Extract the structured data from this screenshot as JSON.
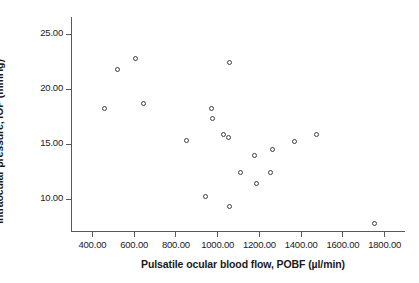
{
  "chart_data": {
    "type": "scatter",
    "title": "",
    "xlabel": "Pulsatile ocular blood flow, POBF (µl/min)",
    "ylabel": "Intraocular pressure, IOP (mmHg)",
    "xlim": [
      300,
      1900
    ],
    "ylim": [
      7,
      26.5
    ],
    "grid": false,
    "legend": null,
    "xticks": [
      400,
      600,
      800,
      1000,
      1200,
      1400,
      1600,
      1800
    ],
    "xtick_labels": [
      "400.00",
      "600.00",
      "800.00",
      "1000.00",
      "1200.00",
      "1400.00",
      "1600.00",
      "1800.00"
    ],
    "yticks": [
      10,
      15,
      20,
      25
    ],
    "ytick_labels": [
      "10.00",
      "15.00",
      "20.00",
      "25.00"
    ],
    "marker": "open-circle",
    "marker_color": "#3a3f44",
    "points": [
      {
        "x": 460,
        "y": 18.2
      },
      {
        "x": 525,
        "y": 21.7
      },
      {
        "x": 610,
        "y": 22.7
      },
      {
        "x": 645,
        "y": 18.7
      },
      {
        "x": 855,
        "y": 15.3
      },
      {
        "x": 945,
        "y": 10.2
      },
      {
        "x": 975,
        "y": 18.2
      },
      {
        "x": 980,
        "y": 17.3
      },
      {
        "x": 1030,
        "y": 15.8
      },
      {
        "x": 1055,
        "y": 15.6
      },
      {
        "x": 1060,
        "y": 22.4
      },
      {
        "x": 1060,
        "y": 9.3
      },
      {
        "x": 1110,
        "y": 12.4
      },
      {
        "x": 1180,
        "y": 13.9
      },
      {
        "x": 1190,
        "y": 11.4
      },
      {
        "x": 1255,
        "y": 12.4
      },
      {
        "x": 1265,
        "y": 14.5
      },
      {
        "x": 1370,
        "y": 15.2
      },
      {
        "x": 1475,
        "y": 15.8
      },
      {
        "x": 1755,
        "y": 7.8
      }
    ]
  },
  "figure": {
    "background": "#ffffff",
    "axis_color": "#555a5e",
    "text_color": "#1a1a1a"
  }
}
